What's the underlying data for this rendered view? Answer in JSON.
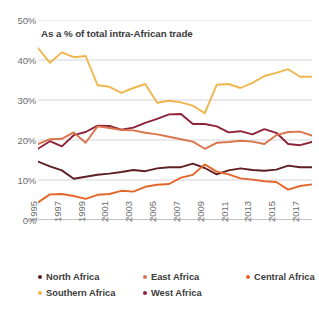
{
  "subtitle": "As a % of total intra-African trade",
  "axis": {
    "y_ticks": [
      "0%",
      "10%",
      "20%",
      "30%",
      "40%",
      "50%"
    ],
    "x_ticks": [
      "1995",
      "1997",
      "1999",
      "2001",
      "2003",
      "2005",
      "2007",
      "2009",
      "2011",
      "2013",
      "2015",
      "2017"
    ]
  },
  "legend": {
    "items": [
      {
        "label": "North Africa",
        "color": "#5E1F22"
      },
      {
        "label": "East Africa",
        "color": "#D9744C"
      },
      {
        "label": "Central Africa",
        "color": "#E4662A"
      },
      {
        "label": "Southern Africa",
        "color": "#EFB64C"
      },
      {
        "label": "West Africa",
        "color": "#8E2239"
      }
    ]
  },
  "chart_data": {
    "type": "line",
    "title": "",
    "subtitle": "As a % of total intra-African trade",
    "xlabel": "",
    "ylabel": "",
    "xlim": [
      1995,
      2018
    ],
    "ylim": [
      0,
      50
    ],
    "y_unit": "%",
    "grid": "horizontal",
    "legend_position": "bottom",
    "x": [
      1995,
      1996,
      1997,
      1998,
      1999,
      2000,
      2001,
      2002,
      2003,
      2004,
      2005,
      2006,
      2007,
      2008,
      2009,
      2010,
      2011,
      2012,
      2013,
      2014,
      2015,
      2016,
      2017,
      2018
    ],
    "x_tick_labels": [
      "1995",
      "1997",
      "1999",
      "2001",
      "2003",
      "2005",
      "2007",
      "2009",
      "2011",
      "2013",
      "2015",
      "2017"
    ],
    "y_ticks": [
      0,
      10,
      20,
      30,
      40,
      50
    ],
    "series": [
      {
        "name": "Southern Africa",
        "color": "#EFB64C",
        "values": [
          43.0,
          39.3,
          41.9,
          40.7,
          41.0,
          33.7,
          33.3,
          31.8,
          33.0,
          34.0,
          29.3,
          29.8,
          29.4,
          28.6,
          26.7,
          33.8,
          34.0,
          33.0,
          34.3,
          36.0,
          36.8,
          37.7,
          35.8,
          35.8
        ]
      },
      {
        "name": "West Africa",
        "color": "#8E2239",
        "values": [
          17.8,
          19.7,
          18.4,
          21.2,
          22.0,
          23.6,
          23.5,
          22.6,
          23.1,
          24.3,
          25.3,
          26.4,
          26.5,
          24.0,
          24.0,
          23.4,
          21.9,
          22.2,
          21.4,
          22.7,
          21.8,
          19.0,
          18.7,
          19.5
        ]
      },
      {
        "name": "East Africa",
        "color": "#D9744C",
        "values": [
          19.0,
          20.2,
          20.3,
          21.9,
          19.3,
          23.4,
          23.0,
          22.5,
          22.4,
          21.8,
          21.4,
          20.8,
          20.2,
          19.6,
          17.8,
          19.3,
          19.5,
          19.8,
          19.6,
          19.0,
          21.2,
          22.0,
          22.1,
          21.1
        ]
      },
      {
        "name": "North Africa",
        "color": "#5E1F22",
        "values": [
          14.6,
          13.4,
          12.4,
          10.3,
          10.8,
          11.3,
          11.6,
          12.0,
          12.5,
          12.2,
          12.9,
          13.2,
          13.2,
          14.1,
          13.0,
          11.4,
          12.4,
          12.9,
          12.5,
          12.3,
          12.6,
          13.6,
          13.2,
          13.2
        ]
      },
      {
        "name": "Central Africa",
        "color": "#E4662A",
        "values": [
          4.4,
          6.4,
          6.5,
          6.0,
          5.3,
          6.3,
          6.5,
          7.3,
          7.1,
          8.3,
          8.8,
          9.0,
          10.6,
          11.3,
          13.9,
          12.1,
          11.4,
          10.4,
          10.1,
          9.7,
          9.5,
          7.6,
          8.5,
          8.9
        ]
      }
    ]
  }
}
